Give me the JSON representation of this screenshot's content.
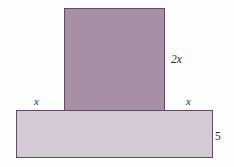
{
  "figure": {
    "background_color": "#fdfdfd",
    "stroke_color": "#5e4d60",
    "shapes": {
      "vertical_rect": {
        "name": "upper vertical rectangle",
        "fill_color": "#a78fa5",
        "width_expression": "2x",
        "height_expression": "2x"
      },
      "horizontal_rect": {
        "name": "lower horizontal base rectangle",
        "fill_color": "#d3cbd4",
        "height_expression": "5"
      }
    },
    "labels": {
      "height_2x": "2x",
      "left_x": "x",
      "right_x": "x",
      "depth_5": "5"
    }
  }
}
